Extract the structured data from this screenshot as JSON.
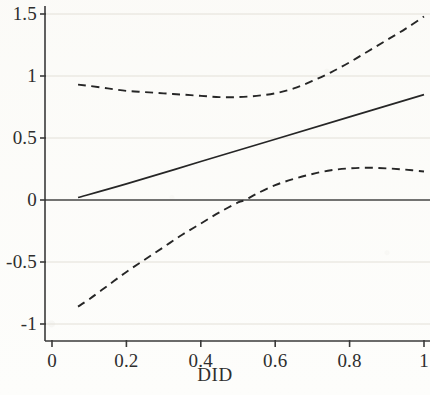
{
  "chart_data": {
    "type": "line",
    "title": "",
    "subtitle": "",
    "xlabel": "DID",
    "ylabel": "",
    "xlim": [
      -0.06,
      1.06
    ],
    "ylim": [
      -1.12,
      1.62
    ],
    "xticks": [
      0,
      0.2,
      0.4,
      0.6,
      0.8,
      1
    ],
    "xtick_labels": [
      "0",
      "0.2",
      "0.4",
      "0.6",
      "0.8",
      "1"
    ],
    "yticks": [
      -1,
      -0.5,
      0,
      0.5,
      1,
      1.5
    ],
    "ytick_labels": [
      "-1",
      "-0.5",
      "0",
      "0.5",
      "1",
      "1.5"
    ],
    "grid": true,
    "grid_axis": "y",
    "legend": null,
    "zero_line": 0,
    "series": [
      {
        "name": "Upper confidence bound",
        "style": "dashed",
        "color": "#262626",
        "x": [
          0.07,
          0.1,
          0.15,
          0.2,
          0.25,
          0.3,
          0.35,
          0.4,
          0.45,
          0.5,
          0.55,
          0.6,
          0.65,
          0.7,
          0.75,
          0.8,
          0.85,
          0.9,
          0.95,
          1.0
        ],
        "values": [
          0.93,
          0.92,
          0.9,
          0.88,
          0.87,
          0.86,
          0.85,
          0.84,
          0.83,
          0.83,
          0.84,
          0.86,
          0.9,
          0.96,
          1.03,
          1.11,
          1.2,
          1.29,
          1.38,
          1.48
        ]
      },
      {
        "name": "Estimated effect",
        "style": "solid",
        "color": "#262626",
        "x": [
          0.07,
          0.2,
          0.4,
          0.6,
          0.8,
          1.0
        ],
        "values": [
          0.02,
          0.13,
          0.31,
          0.49,
          0.67,
          0.85
        ]
      },
      {
        "name": "Lower confidence bound",
        "style": "dashed",
        "color": "#262626",
        "x": [
          0.07,
          0.1,
          0.15,
          0.2,
          0.25,
          0.3,
          0.35,
          0.4,
          0.45,
          0.5,
          0.52,
          0.55,
          0.6,
          0.65,
          0.7,
          0.75,
          0.8,
          0.85,
          0.9,
          0.95,
          1.0
        ],
        "values": [
          -0.86,
          -0.8,
          -0.69,
          -0.58,
          -0.48,
          -0.38,
          -0.28,
          -0.19,
          -0.1,
          -0.02,
          0.0,
          0.05,
          0.12,
          0.17,
          0.21,
          0.24,
          0.255,
          0.26,
          0.255,
          0.245,
          0.23
        ]
      }
    ]
  },
  "axis": {
    "xlabel": "DID"
  }
}
